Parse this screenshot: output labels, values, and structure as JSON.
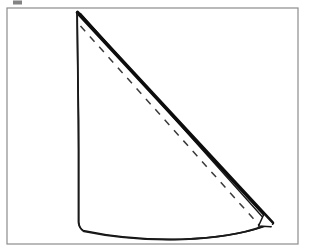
{
  "document": {
    "type": "line-drawing-figure",
    "title": "Folded cone / fan paper-fold diagram",
    "background_color": "#ffffff",
    "width": 314,
    "height": 249
  },
  "frame": {
    "name": "figure-border",
    "x": 7,
    "y": 8,
    "width": 291,
    "height": 236,
    "stroke_color": "#8c8c8c",
    "stroke_width": 1.2,
    "fill": "none"
  },
  "artifacts": {
    "top_smudge": {
      "name": "cropped-text-fragment",
      "x": 13,
      "y": 0,
      "width": 9,
      "height": 4,
      "color": "#5a5a5a"
    }
  },
  "shape": {
    "name": "folded-cone",
    "fill": "#ffffff",
    "stroke_color": "#111111",
    "description": "A quarter-circle fan folded into a cone, seen flat, with a thick folded right edge and a dashed interior fold line",
    "apex": {
      "x": 77,
      "y": 12
    },
    "left_edge_bottom": {
      "x": 78.5,
      "y": 227
    },
    "tip_outer": {
      "x": 272,
      "y": 223
    },
    "tip_inner": {
      "x": 266,
      "y": 214
    },
    "arc_low_point": {
      "x": 178,
      "y": 239
    }
  },
  "paths": {
    "outline": {
      "name": "cone-outline-path",
      "d": "M 77 12 L 78.6 120 L 78.6 222 Q 79.0 227.5 83 230.5 Q 130 240.5 182 239.2 Q 232 237.4 262.5 227.0 L 272.5 223.5 Z",
      "stroke_width": 1.6
    },
    "thick_fold_edge": {
      "name": "thick-folded-edge",
      "d": "M 77.5 12.5 L 272.5 223.0",
      "stroke_width": 3.6,
      "color": "#0d0d0d"
    },
    "thin_fold_edge": {
      "name": "thin-folded-edge-parallel",
      "d": "M 80.5 13.5 L 271.0 226.5",
      "stroke_width": 1.4,
      "color": "#1a1a1a"
    },
    "notch": {
      "name": "fold-tip-notch",
      "d": "M 272.5 223.0 L 264.0 214.0 L 258.5 226.0 L 271.0 226.8",
      "stroke_width": 1.5,
      "color": "#141414"
    },
    "left_edge": {
      "name": "cone-left-edge",
      "d": "M 77.2 13 L 78.6 150 L 78.6 223.5",
      "stroke_width": 1.7,
      "color": "#1a1a1a"
    },
    "bottom_arc": {
      "name": "cone-bottom-arc",
      "d": "M 78.8 223.5 Q 79.2 228.5 84 231.5 Q 131 241.2 183 239.4 Q 233 237.2 262 226.6",
      "stroke_width": 1.7,
      "color": "#1a1a1a"
    },
    "dashed_fold": {
      "name": "dashed-fold-line",
      "d": "M 80.5 26 L 259.5 225.5",
      "stroke_width": 1.5,
      "color": "#3a3a3a",
      "dash_pattern": "7 7"
    }
  },
  "labels": {
    "figure_caption": "",
    "annotations": []
  },
  "colors": {
    "ink": "#111111",
    "frame": "#8c8c8c",
    "paper": "#ffffff",
    "dash": "#3a3a3a"
  }
}
